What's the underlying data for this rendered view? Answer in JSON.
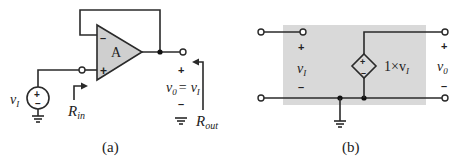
{
  "figure_a": {
    "caption": "(a)",
    "opamp_label": "A",
    "opamp_inverting_sign": "–",
    "opamp_noninverting_sign": "+",
    "source_label_main": "v",
    "source_label_sub": "I",
    "source_plus": "+",
    "source_minus": "–",
    "rin_main": "R",
    "rin_sub": "in",
    "output_plus": "+",
    "output_minus": "–",
    "output_eq_v0_main": "v",
    "output_eq_v0_sub": "0",
    "output_eq_sign": "=",
    "output_eq_vi_main": "v",
    "output_eq_vi_sub": "I",
    "rout_main": "R",
    "rout_sub": "out",
    "colors": {
      "opamp_fill": "#cfcfcf",
      "wire": "#2a2a2a"
    }
  },
  "figure_b": {
    "caption": "(b)",
    "input_plus": "+",
    "input_minus": "–",
    "input_v_main": "v",
    "input_v_sub": "I",
    "source_plus": "+",
    "source_minus": "–",
    "source_gain_text": "1×v",
    "source_gain_sub": "I",
    "output_plus": "+",
    "output_minus": "–",
    "output_v_main": "v",
    "output_v_sub": "0",
    "colors": {
      "box_fill": "#d9d9d9"
    }
  }
}
